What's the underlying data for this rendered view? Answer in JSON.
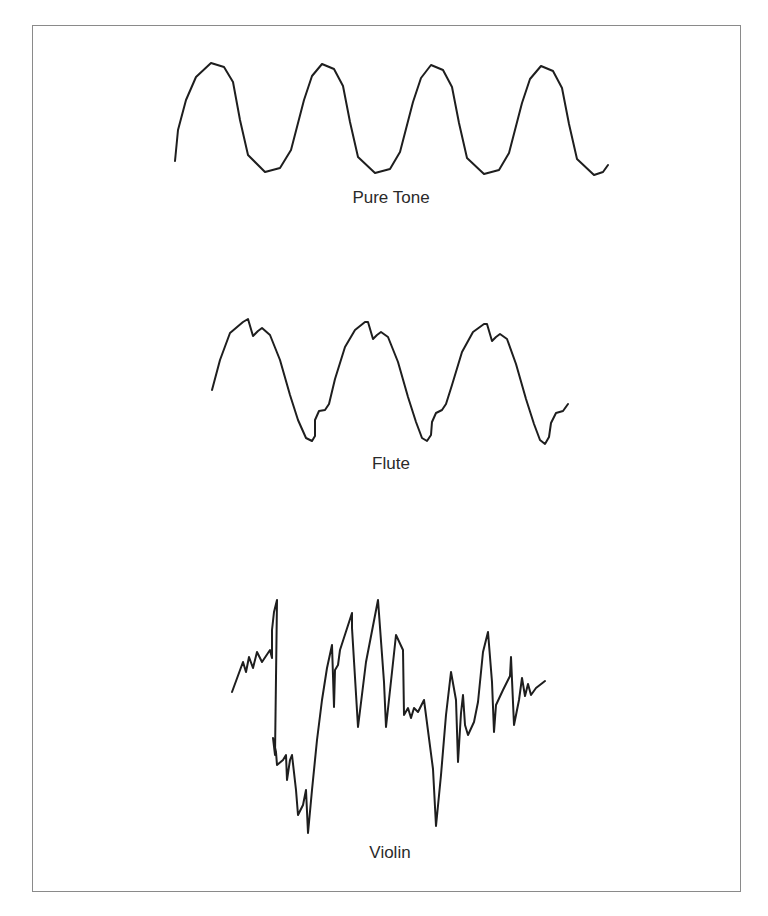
{
  "figure": {
    "panels": [
      {
        "id": "pure-tone",
        "label": "Pure Tone",
        "points": [
          [
            175,
            161
          ],
          [
            178,
            130
          ],
          [
            186,
            100
          ],
          [
            196,
            77
          ],
          [
            211,
            63
          ],
          [
            224,
            67
          ],
          [
            233,
            82
          ],
          [
            240,
            120
          ],
          [
            248,
            155
          ],
          [
            265,
            172
          ],
          [
            280,
            168
          ],
          [
            291,
            150
          ],
          [
            304,
            100
          ],
          [
            312,
            76
          ],
          [
            322,
            64
          ],
          [
            334,
            69
          ],
          [
            343,
            86
          ],
          [
            350,
            122
          ],
          [
            358,
            157
          ],
          [
            375,
            173
          ],
          [
            390,
            169
          ],
          [
            400,
            152
          ],
          [
            413,
            102
          ],
          [
            421,
            78
          ],
          [
            431,
            65
          ],
          [
            443,
            70
          ],
          [
            452,
            87
          ],
          [
            459,
            123
          ],
          [
            467,
            158
          ],
          [
            484,
            174
          ],
          [
            499,
            170
          ],
          [
            509,
            153
          ],
          [
            522,
            103
          ],
          [
            530,
            79
          ],
          [
            541,
            66
          ],
          [
            553,
            71
          ],
          [
            562,
            88
          ],
          [
            569,
            124
          ],
          [
            577,
            159
          ],
          [
            594,
            175
          ],
          [
            603,
            172
          ],
          [
            608,
            165
          ]
        ]
      },
      {
        "id": "flute",
        "label": "Flute",
        "points": [
          [
            212,
            390
          ],
          [
            220,
            360
          ],
          [
            230,
            333
          ],
          [
            243,
            322
          ],
          [
            248,
            319
          ],
          [
            253,
            336
          ],
          [
            258,
            331
          ],
          [
            262,
            328
          ],
          [
            270,
            335
          ],
          [
            280,
            360
          ],
          [
            290,
            395
          ],
          [
            298,
            420
          ],
          [
            306,
            438
          ],
          [
            312,
            441
          ],
          [
            315,
            436
          ],
          [
            315,
            420
          ],
          [
            319,
            411
          ],
          [
            325,
            410
          ],
          [
            329,
            404
          ],
          [
            335,
            379
          ],
          [
            345,
            347
          ],
          [
            355,
            330
          ],
          [
            365,
            322
          ],
          [
            368,
            322
          ],
          [
            373,
            339
          ],
          [
            377,
            335
          ],
          [
            381,
            332
          ],
          [
            388,
            337
          ],
          [
            398,
            362
          ],
          [
            408,
            397
          ],
          [
            416,
            422
          ],
          [
            422,
            438
          ],
          [
            427,
            441
          ],
          [
            431,
            435
          ],
          [
            432,
            422
          ],
          [
            436,
            413
          ],
          [
            442,
            410
          ],
          [
            446,
            404
          ],
          [
            452,
            385
          ],
          [
            462,
            352
          ],
          [
            473,
            332
          ],
          [
            484,
            324
          ],
          [
            487,
            324
          ],
          [
            492,
            341
          ],
          [
            496,
            337
          ],
          [
            500,
            334
          ],
          [
            507,
            339
          ],
          [
            516,
            364
          ],
          [
            526,
            399
          ],
          [
            534,
            424
          ],
          [
            540,
            440
          ],
          [
            545,
            444
          ],
          [
            549,
            437
          ],
          [
            551,
            423
          ],
          [
            556,
            413
          ],
          [
            563,
            411
          ],
          [
            568,
            404
          ]
        ]
      },
      {
        "id": "violin",
        "label": "Violin",
        "points": [
          [
            232,
            692
          ],
          [
            243,
            662
          ],
          [
            246,
            672
          ],
          [
            249,
            657
          ],
          [
            253,
            668
          ],
          [
            257,
            652
          ],
          [
            262,
            662
          ],
          [
            270,
            650
          ],
          [
            272,
            658
          ],
          [
            272,
            630
          ],
          [
            274,
            612
          ],
          [
            277,
            600
          ],
          [
            275,
            755
          ],
          [
            273,
            738
          ],
          [
            276,
            752
          ],
          [
            277,
            765
          ],
          [
            283,
            760
          ],
          [
            286,
            755
          ],
          [
            287,
            780
          ],
          [
            290,
            760
          ],
          [
            292,
            755
          ],
          [
            296,
            790
          ],
          [
            298,
            815
          ],
          [
            303,
            805
          ],
          [
            306,
            790
          ],
          [
            308,
            833
          ],
          [
            312,
            790
          ],
          [
            317,
            740
          ],
          [
            322,
            700
          ],
          [
            327,
            668
          ],
          [
            332,
            645
          ],
          [
            334,
            707
          ],
          [
            335,
            670
          ],
          [
            338,
            665
          ],
          [
            340,
            650
          ],
          [
            352,
            613
          ],
          [
            352,
            628
          ],
          [
            358,
            727
          ],
          [
            366,
            662
          ],
          [
            378,
            600
          ],
          [
            384,
            682
          ],
          [
            386,
            727
          ],
          [
            392,
            672
          ],
          [
            396,
            635
          ],
          [
            403,
            650
          ],
          [
            404,
            715
          ],
          [
            408,
            708
          ],
          [
            411,
            718
          ],
          [
            414,
            708
          ],
          [
            418,
            712
          ],
          [
            424,
            700
          ],
          [
            433,
            769
          ],
          [
            436,
            826
          ],
          [
            441,
            775
          ],
          [
            446,
            715
          ],
          [
            451,
            672
          ],
          [
            456,
            700
          ],
          [
            458,
            762
          ],
          [
            461,
            713
          ],
          [
            463,
            695
          ],
          [
            465,
            725
          ],
          [
            468,
            735
          ],
          [
            474,
            722
          ],
          [
            478,
            702
          ],
          [
            483,
            652
          ],
          [
            488,
            632
          ],
          [
            492,
            682
          ],
          [
            494,
            732
          ],
          [
            496,
            705
          ],
          [
            503,
            690
          ],
          [
            510,
            676
          ],
          [
            511,
            657
          ],
          [
            514,
            725
          ],
          [
            519,
            700
          ],
          [
            522,
            678
          ],
          [
            525,
            696
          ],
          [
            528,
            684
          ],
          [
            531,
            695
          ],
          [
            536,
            688
          ],
          [
            545,
            681
          ]
        ]
      }
    ],
    "stroke_color": "#1e1e1e",
    "frame_color": "#8a8a8a",
    "label_color": "#2a2a2a"
  }
}
